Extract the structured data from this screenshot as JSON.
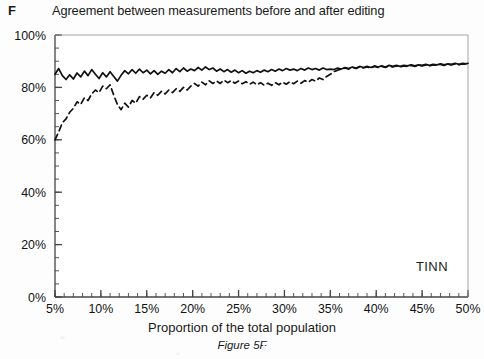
{
  "panel": {
    "label": "F"
  },
  "title": "Agreement between measurements before and after editing",
  "x_axis_title": "Proportion of the total population",
  "caption": "Figure 5F",
  "annotation": "TINN",
  "colors": {
    "line": "#111111",
    "axis": "#444444",
    "background": "#fdfdfd",
    "plot_background": "#ffffff"
  },
  "chart_data": {
    "type": "line",
    "title": "Agreement between measurements before and after editing",
    "xlabel": "Proportion of the total population",
    "ylabel": "",
    "annotation": "TINN",
    "caption": "Figure 5F",
    "xlim": [
      5,
      50
    ],
    "ylim": [
      0,
      100
    ],
    "x_tick_labels": [
      "5%",
      "10%",
      "15%",
      "20%",
      "25%",
      "30%",
      "35%",
      "40%",
      "45%",
      "50%"
    ],
    "x_ticks": [
      5,
      10,
      15,
      20,
      25,
      30,
      35,
      40,
      45,
      50
    ],
    "x_minor_tick_step": 1,
    "y_tick_labels": [
      "0%",
      "20%",
      "40%",
      "60%",
      "80%",
      "100%"
    ],
    "y_ticks": [
      0,
      20,
      40,
      60,
      80,
      100
    ],
    "y_minor_tick_step": 5,
    "grid": false,
    "legend": null,
    "series": [
      {
        "name": "solid",
        "style": "solid",
        "x": [
          5.0,
          5.4,
          5.8,
          6.2,
          6.6,
          7.0,
          7.4,
          7.8,
          8.2,
          8.6,
          9.0,
          9.4,
          9.8,
          10.2,
          10.6,
          11.0,
          11.4,
          11.8,
          12.2,
          12.6,
          13.0,
          13.4,
          13.8,
          14.2,
          14.6,
          15.0,
          15.4,
          15.8,
          16.2,
          16.6,
          17.0,
          17.4,
          17.8,
          18.2,
          18.6,
          19.0,
          19.4,
          19.8,
          20.2,
          20.6,
          21.0,
          21.4,
          21.8,
          22.2,
          22.6,
          23.0,
          23.4,
          23.8,
          24.2,
          24.6,
          25.0,
          25.4,
          25.8,
          26.2,
          26.6,
          27.0,
          27.4,
          27.8,
          28.2,
          28.6,
          29.0,
          29.4,
          29.8,
          30.2,
          30.6,
          31.0,
          31.4,
          31.8,
          32.2,
          32.6,
          33.0,
          33.4,
          33.8,
          34.2,
          34.6,
          35.0,
          35.4,
          35.8,
          36.2,
          36.6,
          37.0,
          37.4,
          37.8,
          38.2,
          38.6,
          39.0,
          39.4,
          39.8,
          40.2,
          40.6,
          41.0,
          41.4,
          41.8,
          42.2,
          42.6,
          43.0,
          43.4,
          43.8,
          44.2,
          44.6,
          45.0,
          45.4,
          45.8,
          46.2,
          46.6,
          47.0,
          47.4,
          47.8,
          48.2,
          48.6,
          49.0,
          49.4,
          49.8,
          50.0
        ],
        "y": [
          85.0,
          87.2,
          84.5,
          83.0,
          84.8,
          83.2,
          85.5,
          84.0,
          86.2,
          84.5,
          86.8,
          85.0,
          83.4,
          85.6,
          84.0,
          86.0,
          84.2,
          82.4,
          84.6,
          86.4,
          85.2,
          86.8,
          85.4,
          87.0,
          85.6,
          86.6,
          85.2,
          86.4,
          85.0,
          86.2,
          85.4,
          86.8,
          85.6,
          87.2,
          86.0,
          87.4,
          86.2,
          87.0,
          86.4,
          87.6,
          86.6,
          87.8,
          86.8,
          87.4,
          86.2,
          87.0,
          86.0,
          86.8,
          85.8,
          86.6,
          85.6,
          86.4,
          85.4,
          86.2,
          85.6,
          86.4,
          85.8,
          86.6,
          86.0,
          86.8,
          86.2,
          87.0,
          86.4,
          87.2,
          86.6,
          87.0,
          86.4,
          87.2,
          86.6,
          87.4,
          86.8,
          87.2,
          86.6,
          87.4,
          86.8,
          87.0,
          86.8,
          87.4,
          87.0,
          87.6,
          87.2,
          87.8,
          87.4,
          88.0,
          87.6,
          88.0,
          87.6,
          88.2,
          87.8,
          88.2,
          87.8,
          88.4,
          88.0,
          88.4,
          88.0,
          88.4,
          88.2,
          88.6,
          88.2,
          88.6,
          88.4,
          88.8,
          88.4,
          88.8,
          88.6,
          89.0,
          88.6,
          89.0,
          88.8,
          89.2,
          88.8,
          89.2,
          89.0,
          89.2
        ]
      },
      {
        "name": "dashed",
        "style": "dashed",
        "x": [
          5.0,
          5.4,
          5.8,
          6.2,
          6.6,
          7.0,
          7.4,
          7.8,
          8.2,
          8.6,
          9.0,
          9.4,
          9.8,
          10.2,
          10.6,
          11.0,
          11.4,
          11.8,
          12.2,
          12.6,
          13.0,
          13.4,
          13.8,
          14.2,
          14.6,
          15.0,
          15.4,
          15.8,
          16.2,
          16.6,
          17.0,
          17.4,
          17.8,
          18.2,
          18.6,
          19.0,
          19.4,
          19.8,
          20.2,
          20.6,
          21.0,
          21.4,
          21.8,
          22.2,
          22.6,
          23.0,
          23.4,
          23.8,
          24.2,
          24.6,
          25.0,
          25.4,
          25.8,
          26.2,
          26.6,
          27.0,
          27.4,
          27.8,
          28.2,
          28.6,
          29.0,
          29.4,
          29.8,
          30.2,
          30.6,
          31.0,
          31.4,
          31.8,
          32.2,
          32.6,
          33.0,
          33.4,
          33.8,
          34.2,
          34.6,
          35.0,
          35.4,
          35.8,
          36.2,
          36.6,
          37.0,
          37.4,
          37.8,
          38.2,
          38.6,
          39.0,
          39.4,
          39.8,
          40.2,
          40.6,
          41.0,
          41.4,
          41.8,
          42.2,
          42.6,
          43.0,
          43.4,
          43.8,
          44.2,
          44.6,
          45.0,
          45.4,
          45.8,
          46.2,
          46.6,
          47.0,
          47.4,
          47.8,
          48.2,
          48.6,
          49.0,
          49.4,
          49.8,
          50.0
        ],
        "y": [
          60.0,
          63.0,
          66.5,
          68.0,
          70.5,
          72.0,
          74.5,
          73.5,
          76.0,
          75.0,
          77.5,
          79.0,
          78.0,
          80.5,
          79.5,
          81.0,
          77.0,
          73.5,
          71.5,
          74.0,
          72.5,
          75.0,
          74.0,
          76.5,
          75.5,
          77.0,
          76.0,
          78.0,
          77.0,
          78.5,
          77.5,
          79.0,
          78.0,
          79.5,
          78.5,
          80.0,
          79.0,
          80.5,
          81.5,
          80.5,
          82.0,
          81.0,
          82.5,
          81.5,
          82.5,
          81.5,
          82.8,
          81.8,
          82.6,
          81.6,
          82.4,
          81.4,
          82.2,
          81.2,
          82.0,
          81.0,
          81.8,
          80.8,
          81.6,
          80.8,
          81.8,
          81.0,
          82.0,
          81.2,
          82.2,
          81.4,
          82.4,
          81.6,
          82.6,
          82.0,
          83.0,
          82.4,
          83.6,
          83.0,
          84.2,
          85.0,
          86.0,
          86.6,
          87.0,
          87.4,
          87.0,
          87.6,
          87.2,
          87.8,
          87.4,
          87.8,
          87.4,
          88.0,
          87.6,
          88.0,
          87.6,
          88.2,
          87.8,
          88.2,
          87.8,
          88.2,
          88.0,
          88.4,
          88.0,
          88.4,
          88.2,
          88.6,
          88.2,
          88.6,
          88.4,
          88.8,
          88.4,
          88.8,
          88.6,
          89.0,
          88.6,
          89.0,
          88.8,
          89.0
        ]
      }
    ]
  }
}
